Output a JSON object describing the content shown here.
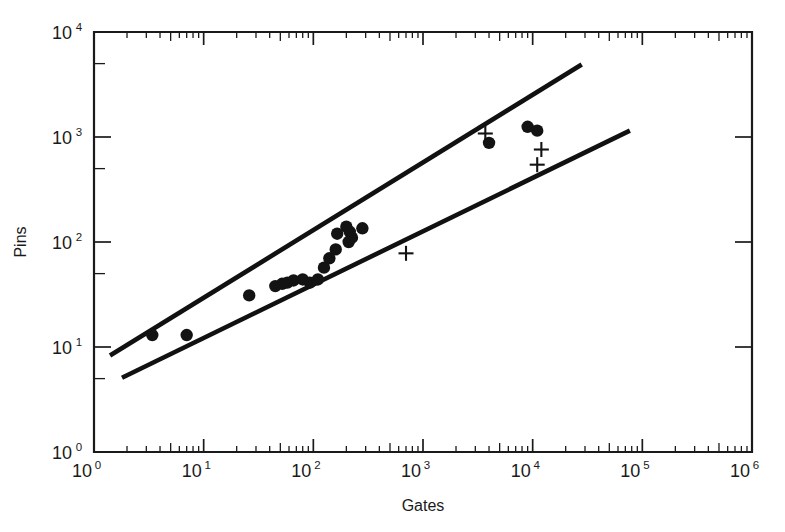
{
  "chart_data": {
    "type": "scatter",
    "title": "",
    "xlabel": "Gates",
    "ylabel": "Pins",
    "xscale": "log",
    "yscale": "log",
    "xlim": [
      1,
      1000000
    ],
    "ylim": [
      1,
      10000
    ],
    "grid": false,
    "legend": "none",
    "x_tick_labels": [
      "10",
      "10",
      "10",
      "10",
      "10",
      "10",
      "10"
    ],
    "x_tick_exponents": [
      "0",
      "1",
      "2",
      "3",
      "4",
      "5",
      "6"
    ],
    "x_tick_values": [
      1,
      10,
      100,
      1000,
      10000,
      100000,
      1000000
    ],
    "y_tick_labels": [
      "10",
      "10",
      "10",
      "10",
      "10"
    ],
    "y_tick_exponents": [
      "0",
      "1",
      "2",
      "3",
      "4"
    ],
    "y_tick_values": [
      1,
      10,
      100,
      1000,
      10000
    ],
    "series": [
      {
        "name": "filled-circles",
        "marker": "circle",
        "color": "#131313",
        "points": [
          {
            "x": 3.4,
            "y": 13
          },
          {
            "x": 7.0,
            "y": 13
          },
          {
            "x": 26,
            "y": 31
          },
          {
            "x": 45,
            "y": 38
          },
          {
            "x": 52,
            "y": 40
          },
          {
            "x": 58,
            "y": 41
          },
          {
            "x": 66,
            "y": 43
          },
          {
            "x": 80,
            "y": 44
          },
          {
            "x": 93,
            "y": 41
          },
          {
            "x": 110,
            "y": 44
          },
          {
            "x": 125,
            "y": 57
          },
          {
            "x": 140,
            "y": 70
          },
          {
            "x": 160,
            "y": 85
          },
          {
            "x": 165,
            "y": 120
          },
          {
            "x": 200,
            "y": 140
          },
          {
            "x": 215,
            "y": 125
          },
          {
            "x": 225,
            "y": 110
          },
          {
            "x": 210,
            "y": 100
          },
          {
            "x": 280,
            "y": 135
          },
          {
            "x": 4000,
            "y": 880
          },
          {
            "x": 9000,
            "y": 1250
          },
          {
            "x": 11000,
            "y": 1150
          }
        ]
      },
      {
        "name": "plus-markers",
        "marker": "plus",
        "color": "#131313",
        "points": [
          {
            "x": 700,
            "y": 78
          },
          {
            "x": 3700,
            "y": 1080
          },
          {
            "x": 12000,
            "y": 760
          },
          {
            "x": 11000,
            "y": 545
          }
        ]
      }
    ],
    "reference_lines": [
      {
        "name": "upper-bound",
        "x_start": 1.4,
        "y_start": 8.3,
        "x_end": 28000,
        "y_end": 4900
      },
      {
        "name": "lower-bound",
        "x_start": 1.8,
        "y_start": 5.1,
        "x_end": 77000,
        "y_end": 1150
      }
    ]
  },
  "axes": {
    "x_title": "Gates",
    "y_title": "Pins"
  }
}
